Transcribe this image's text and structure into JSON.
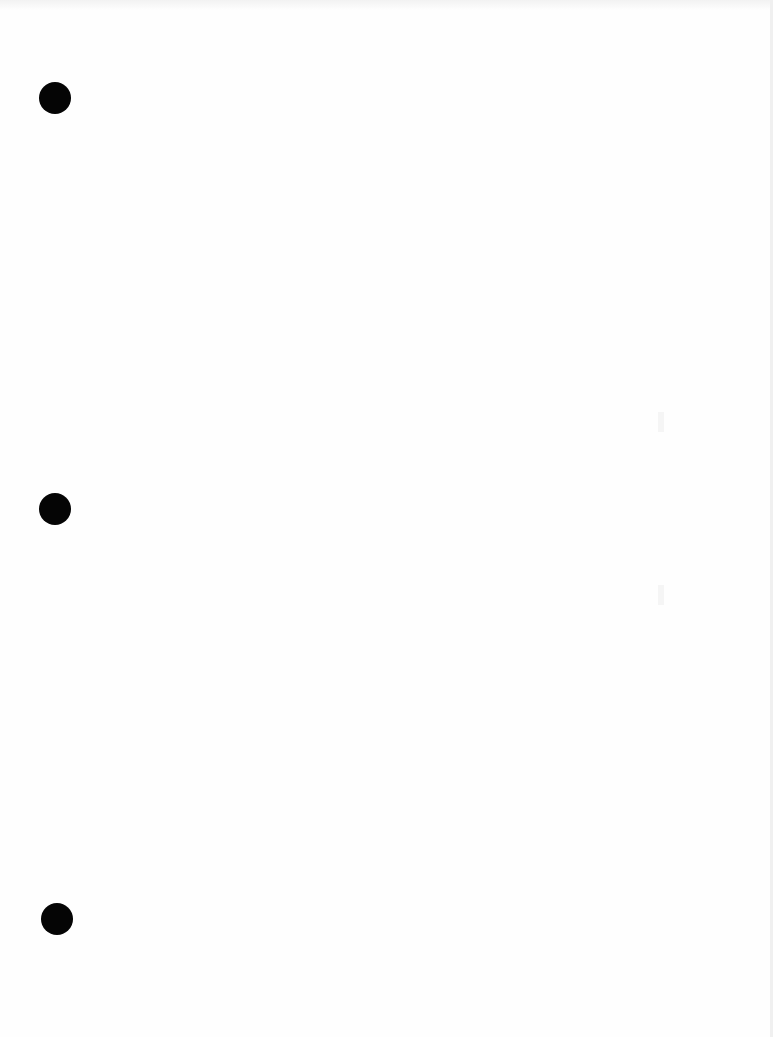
{
  "page": {
    "type": "blank scanned sheet",
    "punch_holes": [
      {
        "name": "top",
        "x": 39,
        "y": 82
      },
      {
        "name": "middle",
        "x": 39,
        "y": 493
      },
      {
        "name": "bottom",
        "x": 41,
        "y": 903
      }
    ],
    "colors": {
      "paper": "#fefefe",
      "hole": "#050505"
    }
  }
}
